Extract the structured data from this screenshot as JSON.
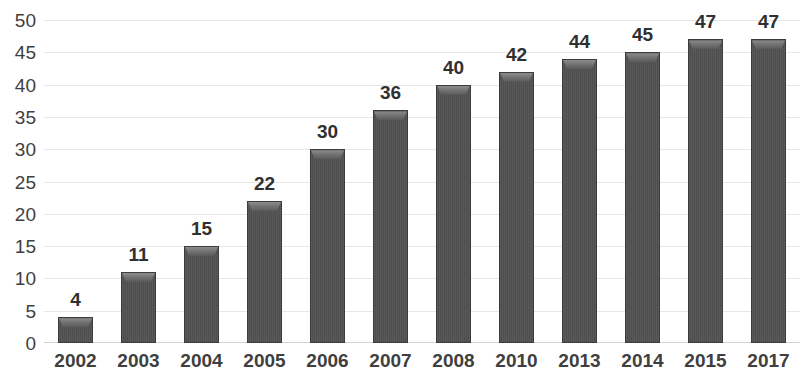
{
  "chart_data": {
    "type": "bar",
    "title": "",
    "subtitle": "",
    "xlabel": "",
    "ylabel": "",
    "categories": [
      "2002",
      "2003",
      "2004",
      "2005",
      "2006",
      "2007",
      "2008",
      "2010",
      "2013",
      "2014",
      "2015",
      "2017"
    ],
    "values": [
      4,
      11,
      15,
      22,
      30,
      36,
      40,
      42,
      44,
      45,
      47,
      47
    ],
    "data_labels": [
      "4",
      "11",
      "15",
      "22",
      "30",
      "36",
      "40",
      "42",
      "44",
      "45",
      "47",
      "47"
    ],
    "ylim": [
      0,
      50
    ],
    "y_tick_step": 5,
    "y_tick_labels": [
      "50",
      "45",
      "40",
      "35",
      "30",
      "25",
      "20",
      "15",
      "10",
      "5",
      "0"
    ],
    "y_tick_values": [
      50,
      45,
      40,
      35,
      30,
      25,
      20,
      15,
      10,
      5,
      0
    ],
    "grid": true,
    "grid_axis": "y",
    "legend": false,
    "legend_position": "none",
    "series": [
      {
        "name": "",
        "values": [
          4,
          11,
          15,
          22,
          30,
          36,
          40,
          42,
          44,
          45,
          47,
          47
        ]
      }
    ],
    "colors": {
      "bar_fill": "#545454",
      "bar_border": "#3c3c3c",
      "bar_highlight": "#8d8d8d",
      "gridline": "#e6e6e6",
      "baseline": "#d3d3d3",
      "axis_text": "#3f3f3f",
      "data_label_text": "#303030",
      "background": "#ffffff"
    }
  }
}
